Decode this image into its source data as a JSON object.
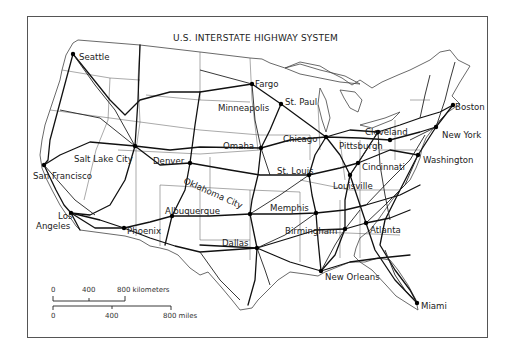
{
  "map": {
    "title": "U.S. INTERSTATE HIGHWAY SYSTEM",
    "cities": [
      {
        "name": "Seattle",
        "x": 73,
        "y": 54,
        "lx": 79,
        "ly": 57
      },
      {
        "name": "San Francisco",
        "x": 44,
        "y": 165,
        "lx": 33,
        "ly": 176
      },
      {
        "name": "Los Angeles",
        "x": 71,
        "y": 213,
        "lx": 52,
        "ly": 219,
        "lines": [
          "Los",
          "Angeles"
        ]
      },
      {
        "name": "Salt Lake City",
        "x": 135,
        "y": 146,
        "lx": 74,
        "ly": 159
      },
      {
        "name": "Denver",
        "x": 190,
        "y": 163,
        "lx": 153,
        "ly": 161
      },
      {
        "name": "Phoenix",
        "x": 124,
        "y": 228,
        "lx": 127,
        "ly": 231
      },
      {
        "name": "Albuquerque",
        "x": 172,
        "y": 216,
        "lx": 165,
        "ly": 211
      },
      {
        "name": "Fargo",
        "x": 252,
        "y": 84,
        "lx": 255,
        "ly": 84
      },
      {
        "name": "Minneapolis",
        "x": 281,
        "y": 104,
        "lx": 218,
        "ly": 108
      },
      {
        "name": "St. Paul",
        "x": 281,
        "y": 104,
        "lx": 285,
        "ly": 102
      },
      {
        "name": "Omaha",
        "x": 261,
        "y": 148,
        "lx": 223,
        "ly": 146
      },
      {
        "name": "Chicago",
        "x": 326,
        "y": 137,
        "lx": 283,
        "ly": 139
      },
      {
        "name": "St. Louis",
        "x": 309,
        "y": 175,
        "lx": 277,
        "ly": 171
      },
      {
        "name": "Oklahoma City",
        "x": 250,
        "y": 214,
        "lx": 183,
        "ly": 183
      },
      {
        "name": "Dallas",
        "x": 257,
        "y": 248,
        "lx": 222,
        "ly": 243
      },
      {
        "name": "Memphis",
        "x": 316,
        "y": 213,
        "lx": 270,
        "ly": 208
      },
      {
        "name": "Birmingham",
        "x": 345,
        "y": 229,
        "lx": 285,
        "ly": 231
      },
      {
        "name": "Atlanta",
        "x": 366,
        "y": 223,
        "lx": 370,
        "ly": 230
      },
      {
        "name": "New Orleans",
        "x": 321,
        "y": 271,
        "lx": 325,
        "ly": 277
      },
      {
        "name": "Miami",
        "x": 417,
        "y": 303,
        "lx": 421,
        "ly": 306
      },
      {
        "name": "Louisville",
        "x": 350,
        "y": 175,
        "lx": 333,
        "ly": 186
      },
      {
        "name": "Cincinnati",
        "x": 358,
        "y": 163,
        "lx": 362,
        "ly": 167
      },
      {
        "name": "Pittsburgh",
        "x": 390,
        "y": 140,
        "lx": 339,
        "ly": 146
      },
      {
        "name": "Cleveland",
        "x": 378,
        "y": 132,
        "lx": 365,
        "ly": 132
      },
      {
        "name": "Washington",
        "x": 418,
        "y": 155,
        "lx": 423,
        "ly": 160
      },
      {
        "name": "New York",
        "x": 436,
        "y": 127,
        "lx": 442,
        "ly": 135
      },
      {
        "name": "Boston",
        "x": 453,
        "y": 105,
        "lx": 455,
        "ly": 107
      }
    ],
    "scale": {
      "km_label": "kilometers",
      "mi_label": "miles",
      "km_ticks": [
        "0",
        "400",
        "800 kilometers"
      ],
      "mi_ticks": [
        "0",
        "400",
        "800 miles"
      ]
    }
  }
}
